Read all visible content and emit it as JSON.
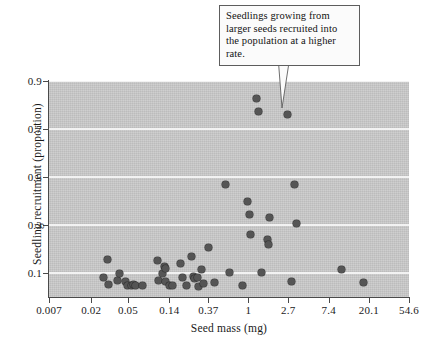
{
  "figure": {
    "annotation": {
      "text": "Seedlings growing from larger seeds recruited into the population at a higher rate."
    },
    "colors": {
      "panel_background": "#c9c9c9",
      "gridline": "#f2f2f2",
      "point_fill": "#555555",
      "axis": "#4a4a4a",
      "annotation_border": "#5d5d5d",
      "annotation_background": "#fbfbfb"
    }
  },
  "chart_data": {
    "type": "scatter",
    "title": "",
    "xlabel": "Seed mass (mg)",
    "ylabel": "Seedling recruitment (proportion)",
    "xscale": "log",
    "yscale": "linear",
    "xlim": [
      0.007,
      54.6
    ],
    "ylim": [
      0.0,
      0.9
    ],
    "grid": true,
    "legend": "none",
    "xticks": [
      "0.007",
      "0.02",
      "0.05",
      "0.14",
      "0.37",
      "1",
      "2.7",
      "7.4",
      "20.1",
      "54.6"
    ],
    "xtick_values": [
      0.007,
      0.02,
      0.05,
      0.14,
      0.37,
      1,
      2.7,
      7.4,
      20.1,
      54.6
    ],
    "yticks": [
      "0.9",
      "0.7",
      "0.5",
      "0.3",
      "0.1"
    ],
    "ytick_values": [
      0.9,
      0.7,
      0.5,
      0.3,
      0.1
    ],
    "series": [
      {
        "name": "Seedling recruitment vs seed mass",
        "marker": "circle",
        "color": "#555555",
        "points": [
          {
            "x": 0.027,
            "y": 0.082
          },
          {
            "x": 0.03,
            "y": 0.155
          },
          {
            "x": 0.031,
            "y": 0.052
          },
          {
            "x": 0.039,
            "y": 0.07
          },
          {
            "x": 0.04,
            "y": 0.098
          },
          {
            "x": 0.047,
            "y": 0.064
          },
          {
            "x": 0.05,
            "y": 0.047
          },
          {
            "x": 0.054,
            "y": 0.046
          },
          {
            "x": 0.058,
            "y": 0.051
          },
          {
            "x": 0.06,
            "y": 0.049
          },
          {
            "x": 0.072,
            "y": 0.047
          },
          {
            "x": 0.105,
            "y": 0.151
          },
          {
            "x": 0.108,
            "y": 0.067
          },
          {
            "x": 0.118,
            "y": 0.1
          },
          {
            "x": 0.125,
            "y": 0.128
          },
          {
            "x": 0.126,
            "y": 0.12
          },
          {
            "x": 0.128,
            "y": 0.066
          },
          {
            "x": 0.14,
            "y": 0.049
          },
          {
            "x": 0.15,
            "y": 0.048
          },
          {
            "x": 0.185,
            "y": 0.14
          },
          {
            "x": 0.195,
            "y": 0.08
          },
          {
            "x": 0.215,
            "y": 0.047
          },
          {
            "x": 0.245,
            "y": 0.17
          },
          {
            "x": 0.255,
            "y": 0.086
          },
          {
            "x": 0.26,
            "y": 0.078
          },
          {
            "x": 0.285,
            "y": 0.08
          },
          {
            "x": 0.29,
            "y": 0.043
          },
          {
            "x": 0.31,
            "y": 0.114
          },
          {
            "x": 0.33,
            "y": 0.056
          },
          {
            "x": 0.37,
            "y": 0.205
          },
          {
            "x": 0.43,
            "y": 0.06
          },
          {
            "x": 0.56,
            "y": 0.47
          },
          {
            "x": 0.62,
            "y": 0.101
          },
          {
            "x": 0.87,
            "y": 0.046
          },
          {
            "x": 0.98,
            "y": 0.4
          },
          {
            "x": 1.02,
            "y": 0.345
          },
          {
            "x": 1.06,
            "y": 0.26
          },
          {
            "x": 1.24,
            "y": 0.827
          },
          {
            "x": 1.28,
            "y": 0.773
          },
          {
            "x": 1.4,
            "y": 0.103
          },
          {
            "x": 1.62,
            "y": 0.24
          },
          {
            "x": 1.66,
            "y": 0.22
          },
          {
            "x": 1.68,
            "y": 0.33
          },
          {
            "x": 2.65,
            "y": 0.76
          },
          {
            "x": 2.9,
            "y": 0.065
          },
          {
            "x": 3.15,
            "y": 0.47
          },
          {
            "x": 3.35,
            "y": 0.305
          },
          {
            "x": 10.2,
            "y": 0.113
          },
          {
            "x": 17.5,
            "y": 0.06
          }
        ]
      }
    ],
    "annotations": [
      {
        "text": "Seedlings growing from larger seeds recruited into the population at a higher rate.",
        "points_to": {
          "x": 1.24,
          "y": 0.827
        }
      }
    ]
  }
}
